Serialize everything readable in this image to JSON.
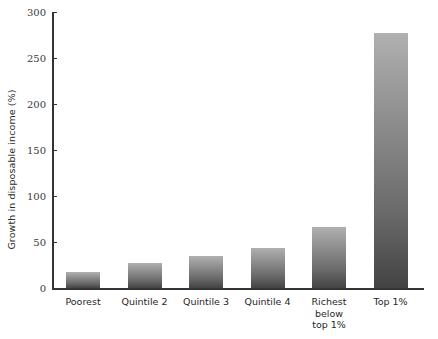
{
  "chart_data": {
    "type": "bar",
    "title": "",
    "subtitle": "",
    "xlabel": "",
    "ylabel": "Growth in disposable income (%)",
    "categories": [
      "Poorest",
      "Quintile 2",
      "Quintile 3",
      "Quintile 4",
      "Richest\nbelow\ntop 1%",
      "Top 1%"
    ],
    "values": [
      17,
      27,
      35,
      43,
      66,
      277
    ],
    "ylim": [
      0,
      300
    ],
    "yticks": [
      0,
      50,
      100,
      150,
      200,
      250,
      300
    ],
    "ytick_labels": [
      "0",
      "50",
      "100",
      "150",
      "200",
      "250",
      "300"
    ],
    "grid": false,
    "legend": null,
    "series": [
      {
        "name": "Growth in disposable income (%)",
        "values": [
          17,
          27,
          35,
          43,
          66,
          277
        ]
      }
    ],
    "bar_fill": "vertical gradient light-gray to dark-gray",
    "colors": {
      "bar_top": "#b0b0b0",
      "bar_bottom": "#434343",
      "axis": "#333333",
      "text": "#1f1f1f",
      "background": "#ffffff"
    }
  }
}
